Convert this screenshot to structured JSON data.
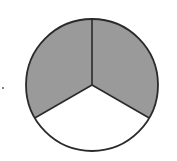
{
  "diagram": {
    "type": "fraction-circle",
    "total_parts": 3,
    "shaded_parts": 2,
    "fraction": "2/3",
    "colors": {
      "shaded": "#9a9a9a",
      "unshaded": "#ffffff",
      "stroke": "#2a2a2a"
    },
    "sectors": [
      {
        "name": "upper-left",
        "shaded": true
      },
      {
        "name": "upper-right",
        "shaded": true
      },
      {
        "name": "bottom",
        "shaded": false
      }
    ],
    "marker": "."
  }
}
